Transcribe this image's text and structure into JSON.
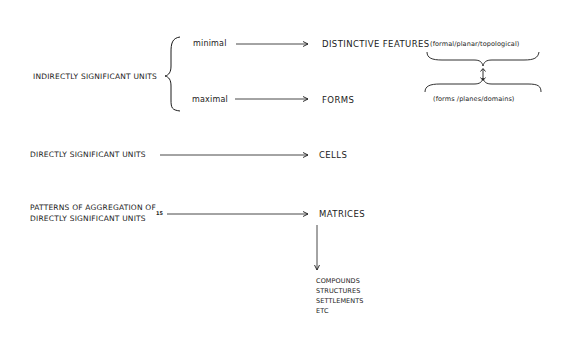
{
  "diagram": {
    "indirect": {
      "label": "INDIRECTLY SIGNIFICANT UNITS",
      "minimal": {
        "label": "minimal",
        "target": "DISTINCTIVE FEATURES",
        "detail": "(formal/planar/topological)"
      },
      "maximal": {
        "label": "maximal",
        "target": "FORMS",
        "detail": "(forms /planes/domains)"
      },
      "relation_symbol": "↕"
    },
    "direct": {
      "label": "DIRECTLY SIGNIFICANT UNITS",
      "target": "CELLS"
    },
    "patterns": {
      "label_line1": "PATTERNS OF AGGREGATION OF",
      "label_line2": "DIRECTLY SIGNIFICANT UNITS",
      "footnote": "15",
      "target": "MATRICES",
      "examples": [
        "COMPOUNDS",
        "STRUCTURES",
        "SETTLEMENTS",
        "ETC"
      ]
    },
    "colors": {
      "ink": "#1a1a1a",
      "paper": "#ffffff"
    }
  }
}
